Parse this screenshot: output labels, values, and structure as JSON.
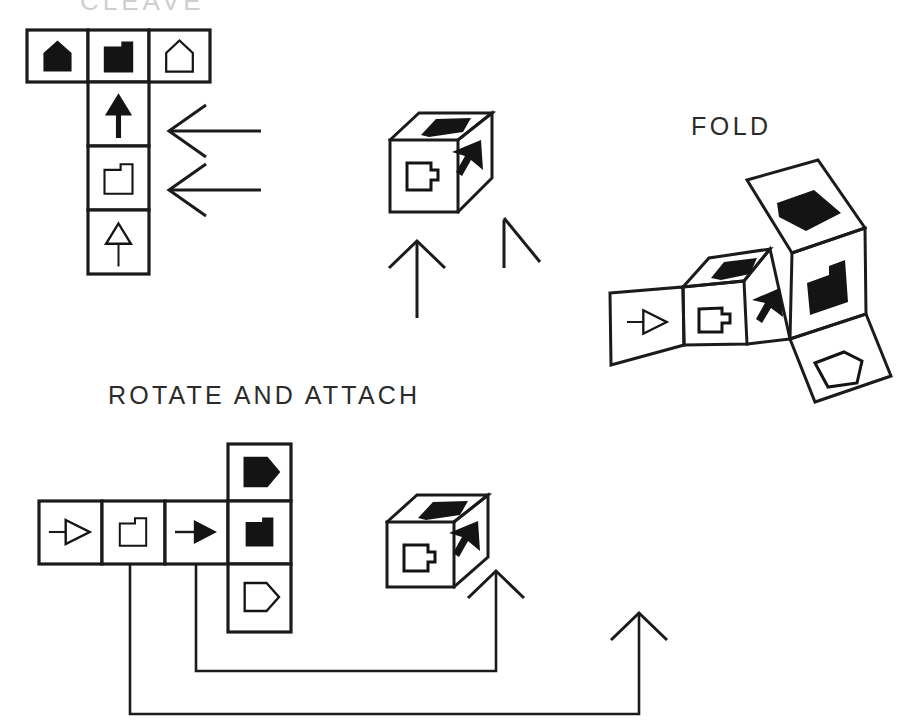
{
  "page": {
    "width": 918,
    "height": 728,
    "background": "#ffffff",
    "ink": "#1b1b1b"
  },
  "labels": {
    "cleave": "CLEAVE",
    "fold": "FOLD",
    "rotate_and_attach": "ROTATE AND ATTACH"
  },
  "diagram": {
    "type": "instructional-cube-net",
    "stages": [
      {
        "id": "stage-cleave",
        "title": "CLEAVE",
        "shape": "T-net",
        "cells": [
          {
            "row": 0,
            "col": 0,
            "glyph": "solid-house",
            "fill": "solid"
          },
          {
            "row": 0,
            "col": 1,
            "glyph": "solid-notched-square",
            "fill": "solid"
          },
          {
            "row": 0,
            "col": 2,
            "glyph": "open-house",
            "fill": "open"
          },
          {
            "row": 1,
            "col": 1,
            "glyph": "solid-up-arrow",
            "fill": "solid"
          },
          {
            "row": 2,
            "col": 1,
            "glyph": "open-notched-square",
            "fill": "open"
          },
          {
            "row": 3,
            "col": 1,
            "glyph": "open-up-arrow",
            "fill": "open"
          }
        ],
        "cue_arrows": [
          {
            "direction": "left",
            "target_cell": "row1-col1"
          },
          {
            "direction": "left",
            "target_cell": "row2-col1"
          }
        ]
      },
      {
        "id": "stage-cube-middle",
        "title": "",
        "shape": "cube",
        "faces": [
          {
            "position": "top",
            "glyph": "solid-pentagon",
            "fill": "solid"
          },
          {
            "position": "front",
            "glyph": "open-notched-square",
            "fill": "open"
          },
          {
            "position": "right",
            "glyph": "solid-arrow-up-right",
            "fill": "solid"
          }
        ],
        "cue_arrows": [
          {
            "direction": "up",
            "style": "full"
          },
          {
            "direction": "up-left",
            "style": "half"
          }
        ]
      },
      {
        "id": "stage-fold",
        "title": "FOLD",
        "shape": "partially-folded-net",
        "faces": [
          {
            "position": "left-flap",
            "glyph": "open-right-arrow",
            "fill": "open"
          },
          {
            "position": "front",
            "glyph": "open-notched-square",
            "fill": "open"
          },
          {
            "position": "top",
            "glyph": "solid-pentagon",
            "fill": "solid"
          },
          {
            "position": "upper-flap",
            "glyph": "solid-pentagon",
            "fill": "solid"
          },
          {
            "position": "right-flap",
            "glyph": "solid-notched-square",
            "fill": "solid"
          },
          {
            "position": "lower-right-flap",
            "glyph": "open-pentagon",
            "fill": "open"
          },
          {
            "position": "side",
            "glyph": "solid-arrow-up-right",
            "fill": "solid"
          }
        ]
      },
      {
        "id": "stage-rotate-attach",
        "title": "ROTATE AND ATTACH",
        "shape": "cross-net",
        "cells": [
          {
            "row": 1,
            "col": 0,
            "glyph": "open-right-arrow",
            "fill": "open"
          },
          {
            "row": 1,
            "col": 1,
            "glyph": "open-notched-square",
            "fill": "open"
          },
          {
            "row": 1,
            "col": 2,
            "glyph": "solid-right-arrow",
            "fill": "solid"
          },
          {
            "row": 0,
            "col": 3,
            "glyph": "solid-pentagon-right",
            "fill": "solid"
          },
          {
            "row": 1,
            "col": 3,
            "glyph": "solid-notched-square",
            "fill": "solid"
          },
          {
            "row": 2,
            "col": 3,
            "glyph": "open-pentagon-right",
            "fill": "open"
          }
        ],
        "result": {
          "shape": "cube",
          "faces": [
            {
              "position": "top",
              "glyph": "solid-pentagon",
              "fill": "solid"
            },
            {
              "position": "front",
              "glyph": "open-notched-square",
              "fill": "open"
            },
            {
              "position": "right",
              "glyph": "solid-arrow-up-right",
              "fill": "solid"
            }
          ]
        },
        "connectors": [
          {
            "from": "row1-col1",
            "to": "result-cube",
            "path": "outer"
          },
          {
            "from": "row1-col2",
            "to": "result-cube",
            "path": "inner"
          }
        ],
        "cue_arrows": [
          {
            "direction": "up",
            "style": "full"
          },
          {
            "direction": "up",
            "style": "full"
          }
        ]
      }
    ]
  }
}
